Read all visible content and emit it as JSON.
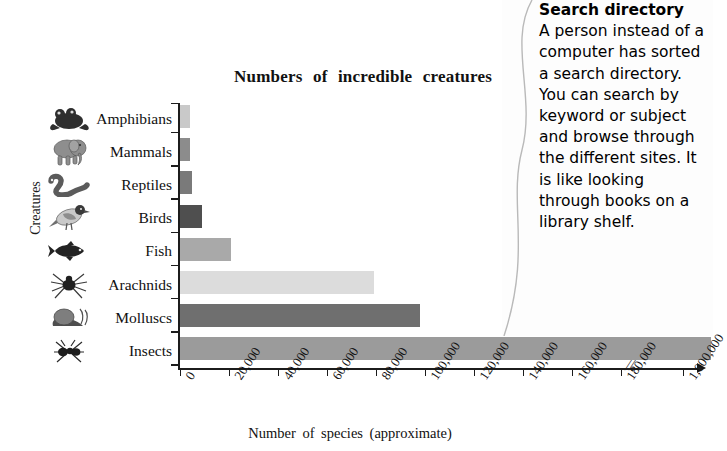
{
  "chart_data": {
    "type": "bar",
    "orientation": "horizontal",
    "title": "Numbers  of  incredible  creatures",
    "xlabel": "Number  of  species  (approximate)",
    "ylabel": "Creatures",
    "categories": [
      "Amphibians",
      "Mammals",
      "Reptiles",
      "Birds",
      "Fish",
      "Arachnids",
      "Molluscs",
      "Insects"
    ],
    "values": [
      4000,
      4000,
      5000,
      9000,
      21000,
      79000,
      98000,
      1000000
    ],
    "icons": [
      "frog-icon",
      "elephant-icon",
      "snake-icon",
      "bird-icon",
      "fish-icon",
      "spider-icon",
      "snail-icon",
      "ant-icon"
    ],
    "bar_colors": [
      "#c9c9c9",
      "#8c8c8c",
      "#7a7a7a",
      "#4f4f4f",
      "#a9a9a9",
      "#dcdcdc",
      "#6f6f6f",
      "#9b9b9b"
    ],
    "xticks": [
      "0",
      "20,000",
      "40,000",
      "60,000",
      "80,000",
      "100,000",
      "120,000",
      "140,000",
      "160,000",
      "180,000",
      "1,000,000"
    ],
    "xtick_values": [
      0,
      20000,
      40000,
      60000,
      80000,
      100000,
      120000,
      140000,
      160000,
      180000,
      1000000
    ],
    "xlim": [
      0,
      200000
    ],
    "axis_break": true,
    "axis_break_symbol": "//",
    "grid": false,
    "legend": false,
    "axis_color": "#1c1c1c"
  },
  "side_note": {
    "heading": "Search directory",
    "body": "A person instead of a computer has sorted a search directory. You can search by keyword or subject and browse through the different sites. It is like looking through books on a library shelf."
  }
}
